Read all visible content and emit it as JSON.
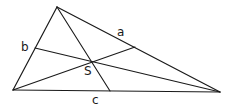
{
  "diagram": {
    "type": "triangle-medians",
    "stroke_color": "#1a1a1a",
    "background": "#ffffff",
    "vertices": {
      "A": {
        "x": 13,
        "y": 90
      },
      "B": {
        "x": 220,
        "y": 92
      },
      "C": {
        "x": 57,
        "y": 7
      }
    },
    "side_midpoints": {
      "a": {
        "x": 135,
        "y": 47
      },
      "b": {
        "x": 35,
        "y": 48
      },
      "c": {
        "x": 110,
        "y": 91
      }
    },
    "centroid": {
      "x": 92,
      "y": 62
    },
    "labels": {
      "a": {
        "text": "a",
        "x": 117,
        "y": 36
      },
      "b": {
        "text": "b",
        "x": 21,
        "y": 51
      },
      "c": {
        "text": "c",
        "x": 92,
        "y": 104
      },
      "S": {
        "text": "S",
        "x": 84,
        "y": 75
      }
    }
  }
}
